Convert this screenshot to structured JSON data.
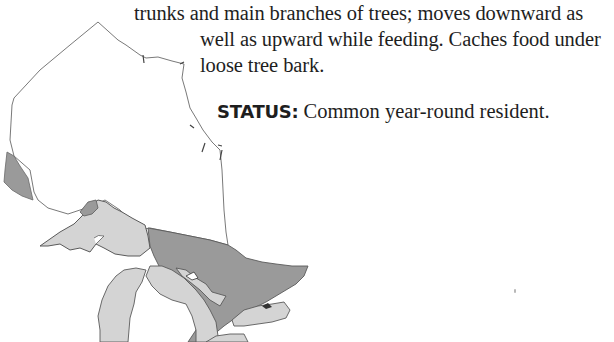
{
  "page": {
    "description_lines": [
      "trunks and main branches of trees; moves downward as",
      "well as upward while feeding. Caches food under",
      "loose tree bark."
    ],
    "status": {
      "label": "STATUS:",
      "value": "Common year-round resident."
    }
  },
  "range_map": {
    "region": "Ontario",
    "colors": {
      "outline": "#6a6a6a",
      "land_unoccupied": "#ffffff",
      "year_round_range": "#9a9a9a",
      "great_lakes": "#d4d4d4",
      "lake_outline": "#5a5a5a"
    }
  }
}
